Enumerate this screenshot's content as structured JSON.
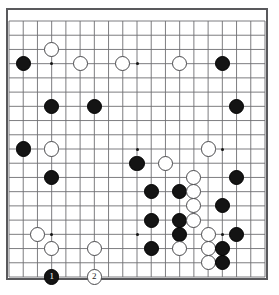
{
  "diagram": {
    "kind": "go-board-diagram",
    "board_size": 19,
    "background_color": "#ffffff",
    "border_color": "#59595c",
    "line_color": "#6e6e72",
    "black_color": "#141414",
    "white_color": "#ffffff",
    "move_numbers": [
      "1",
      "2"
    ],
    "star_points": [
      {
        "col": 3,
        "row": 3
      },
      {
        "col": 9,
        "row": 3
      },
      {
        "col": 15,
        "row": 3
      },
      {
        "col": 3,
        "row": 9
      },
      {
        "col": 9,
        "row": 9
      },
      {
        "col": 15,
        "row": 9
      },
      {
        "col": 3,
        "row": 15
      },
      {
        "col": 9,
        "row": 15
      },
      {
        "col": 15,
        "row": 15
      }
    ],
    "stones": [
      {
        "col": 1,
        "row": 3,
        "color": "black",
        "label": ""
      },
      {
        "col": 3,
        "row": 2,
        "color": "white",
        "label": ""
      },
      {
        "col": 5,
        "row": 3,
        "color": "white",
        "label": ""
      },
      {
        "col": 8,
        "row": 3,
        "color": "white",
        "label": ""
      },
      {
        "col": 12,
        "row": 3,
        "color": "white",
        "label": ""
      },
      {
        "col": 15,
        "row": 3,
        "color": "black",
        "label": ""
      },
      {
        "col": 3,
        "row": 6,
        "color": "black",
        "label": ""
      },
      {
        "col": 6,
        "row": 6,
        "color": "black",
        "label": ""
      },
      {
        "col": 16,
        "row": 6,
        "color": "black",
        "label": ""
      },
      {
        "col": 1,
        "row": 9,
        "color": "black",
        "label": ""
      },
      {
        "col": 3,
        "row": 9,
        "color": "white",
        "label": ""
      },
      {
        "col": 14,
        "row": 9,
        "color": "white",
        "label": ""
      },
      {
        "col": 9,
        "row": 10,
        "color": "black",
        "label": ""
      },
      {
        "col": 11,
        "row": 10,
        "color": "white",
        "label": ""
      },
      {
        "col": 3,
        "row": 11,
        "color": "black",
        "label": ""
      },
      {
        "col": 13,
        "row": 11,
        "color": "white",
        "label": ""
      },
      {
        "col": 16,
        "row": 11,
        "color": "black",
        "label": ""
      },
      {
        "col": 10,
        "row": 12,
        "color": "black",
        "label": ""
      },
      {
        "col": 12,
        "row": 12,
        "color": "black",
        "label": ""
      },
      {
        "col": 13,
        "row": 12,
        "color": "white",
        "label": ""
      },
      {
        "col": 13,
        "row": 13,
        "color": "white",
        "label": ""
      },
      {
        "col": 15,
        "row": 13,
        "color": "black",
        "label": ""
      },
      {
        "col": 10,
        "row": 14,
        "color": "black",
        "label": ""
      },
      {
        "col": 12,
        "row": 14,
        "color": "black",
        "label": ""
      },
      {
        "col": 13,
        "row": 14,
        "color": "white",
        "label": ""
      },
      {
        "col": 2,
        "row": 15,
        "color": "white",
        "label": ""
      },
      {
        "col": 12,
        "row": 15,
        "color": "black",
        "label": ""
      },
      {
        "col": 14,
        "row": 15,
        "color": "white",
        "label": ""
      },
      {
        "col": 16,
        "row": 15,
        "color": "black",
        "label": ""
      },
      {
        "col": 3,
        "row": 16,
        "color": "white",
        "label": ""
      },
      {
        "col": 6,
        "row": 16,
        "color": "white",
        "label": ""
      },
      {
        "col": 10,
        "row": 16,
        "color": "black",
        "label": ""
      },
      {
        "col": 12,
        "row": 16,
        "color": "white",
        "label": ""
      },
      {
        "col": 14,
        "row": 16,
        "color": "white",
        "label": ""
      },
      {
        "col": 15,
        "row": 16,
        "color": "black",
        "label": ""
      },
      {
        "col": 14,
        "row": 17,
        "color": "white",
        "label": ""
      },
      {
        "col": 15,
        "row": 17,
        "color": "black",
        "label": ""
      },
      {
        "col": 3,
        "row": 18,
        "color": "black",
        "label": "1"
      },
      {
        "col": 6,
        "row": 18,
        "color": "white",
        "label": "2"
      }
    ]
  }
}
